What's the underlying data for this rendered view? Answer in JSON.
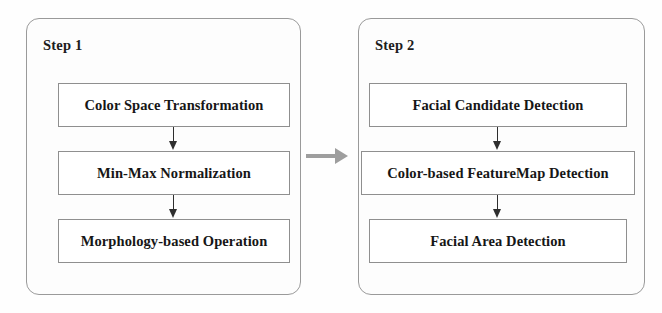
{
  "diagram": {
    "background_color": "#fefefe",
    "box_border_color": "#8f8f8f",
    "panel_border_color": "#9a9a9a",
    "arrow_color": "#2e2e2e",
    "connector_arrow_color": "#9e9e9e",
    "panels": [
      {
        "id": "step1",
        "title": "Step 1",
        "boxes": [
          {
            "id": "color-space-transformation",
            "label": "Color Space Transformation"
          },
          {
            "id": "min-max-normalization",
            "label": "Min-Max Normalization"
          },
          {
            "id": "morphology-based-operation",
            "label": "Morphology-based Operation"
          }
        ]
      },
      {
        "id": "step2",
        "title": "Step 2",
        "boxes": [
          {
            "id": "facial-candidate-detection",
            "label": "Facial Candidate Detection"
          },
          {
            "id": "color-based-featuremap-detection",
            "label": "Color-based FeatureMap Detection"
          },
          {
            "id": "facial-area-detection",
            "label": "Facial Area Detection"
          }
        ]
      }
    ],
    "connector": {
      "from": "step1",
      "to": "step2",
      "icon": "right-arrow-icon"
    }
  }
}
